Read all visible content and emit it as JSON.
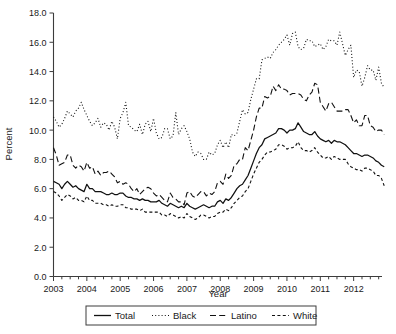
{
  "chart_data": {
    "type": "line",
    "title": "",
    "xlabel": "Year",
    "ylabel": "Percent",
    "ylim": [
      0.0,
      18.0
    ],
    "yticks": [
      0.0,
      2.0,
      4.0,
      6.0,
      8.0,
      10.0,
      12.0,
      14.0,
      16.0,
      18.0
    ],
    "ytick_labels": [
      "0.0",
      "2.0",
      "4.0",
      "6.0",
      "8.0",
      "10.0",
      "12.0",
      "14.0",
      "16.0",
      "18.0"
    ],
    "xlim": [
      2003.0,
      2012.85
    ],
    "xticks": [
      2003,
      2004,
      2005,
      2006,
      2007,
      2008,
      2009,
      2010,
      2011,
      2012
    ],
    "xtick_labels": [
      "2003",
      "2004",
      "2005",
      "2006",
      "2007",
      "2008",
      "2009",
      "2010",
      "2011",
      "2012"
    ],
    "minor_xticks_per_year": 4,
    "grid": false,
    "legend_position": "below-axis-centered",
    "legend_box": true,
    "x_start": 2003.0,
    "x_step": 0.0833333,
    "series": [
      {
        "name": "Total",
        "style": "solid",
        "dash": "none",
        "color": "#111111",
        "values": [
          6.5,
          6.4,
          6.3,
          6.0,
          6.3,
          6.5,
          6.3,
          6.1,
          6.2,
          6.0,
          5.9,
          5.8,
          6.3,
          6.0,
          6.0,
          5.8,
          5.8,
          5.8,
          5.7,
          5.6,
          5.6,
          5.7,
          5.6,
          5.6,
          5.7,
          5.7,
          5.5,
          5.4,
          5.4,
          5.3,
          5.3,
          5.2,
          5.3,
          5.2,
          5.2,
          5.1,
          5.1,
          5.1,
          5.2,
          5.0,
          4.9,
          4.8,
          5.0,
          4.9,
          4.8,
          4.7,
          4.8,
          4.7,
          5.0,
          4.8,
          4.7,
          4.6,
          4.7,
          4.8,
          4.9,
          4.8,
          4.7,
          4.8,
          4.8,
          5.1,
          5.2,
          5.0,
          5.3,
          5.2,
          5.4,
          5.7,
          6.0,
          6.2,
          6.3,
          6.6,
          6.9,
          7.4,
          7.9,
          8.4,
          8.8,
          9.0,
          9.4,
          9.5,
          9.6,
          9.7,
          9.8,
          10.1,
          10.1,
          10.0,
          9.8,
          10.0,
          10.0,
          10.1,
          10.5,
          10.2,
          9.9,
          9.8,
          9.7,
          9.7,
          9.9,
          9.6,
          9.4,
          9.3,
          9.2,
          9.3,
          9.1,
          9.3,
          9.2,
          9.2,
          9.1,
          9.0,
          8.8,
          8.6,
          8.4,
          8.4,
          8.3,
          8.2,
          8.3,
          8.3,
          8.2,
          8.1,
          7.9,
          7.8,
          7.6,
          7.5
        ]
      },
      {
        "name": "Black",
        "style": "dotted",
        "dash": "1,2.2",
        "color": "#111111",
        "values": [
          10.9,
          10.6,
          10.2,
          10.4,
          10.8,
          11.3,
          11.1,
          10.9,
          11.3,
          11.5,
          11.9,
          11.4,
          11.0,
          10.6,
          10.3,
          10.5,
          10.8,
          10.2,
          10.5,
          10.4,
          10.0,
          10.6,
          10.2,
          9.4,
          10.8,
          11.2,
          11.9,
          10.3,
          10.2,
          10.0,
          9.9,
          10.4,
          9.7,
          10.4,
          10.6,
          9.9,
          10.8,
          9.8,
          9.4,
          9.5,
          10.1,
          10.1,
          9.4,
          9.6,
          11.2,
          9.7,
          10.1,
          10.3,
          9.9,
          9.4,
          8.5,
          8.2,
          8.5,
          8.4,
          8.0,
          8.0,
          8.5,
          8.3,
          8.4,
          9.0,
          9.3,
          8.8,
          9.2,
          8.8,
          9.7,
          9.6,
          9.8,
          10.6,
          11.4,
          11.1,
          11.2,
          12.1,
          12.8,
          13.5,
          13.5,
          14.8,
          14.9,
          15.0,
          14.9,
          15.3,
          15.5,
          15.8,
          16.0,
          16.2,
          16.5,
          15.8,
          16.6,
          16.7,
          15.7,
          15.5,
          15.6,
          16.2,
          16.1,
          16.1,
          15.7,
          15.8,
          15.9,
          15.5,
          15.7,
          16.2,
          16.1,
          16.1,
          15.8,
          16.7,
          15.9,
          15.1,
          15.5,
          15.8,
          13.6,
          14.1,
          14.0,
          13.0,
          13.6,
          14.4,
          14.1,
          14.1,
          13.4,
          14.3,
          13.2,
          12.9
        ]
      },
      {
        "name": "Latino",
        "style": "dashed",
        "dash": "6,3.2",
        "color": "#111111",
        "values": [
          8.8,
          8.3,
          7.6,
          7.7,
          7.8,
          8.3,
          8.3,
          7.6,
          7.4,
          7.6,
          7.5,
          7.2,
          7.8,
          7.4,
          7.5,
          7.0,
          7.2,
          6.9,
          7.1,
          7.1,
          7.2,
          7.0,
          6.8,
          6.4,
          6.5,
          6.3,
          6.4,
          6.3,
          6.0,
          5.8,
          6.0,
          5.6,
          5.8,
          6.0,
          6.1,
          6.0,
          5.7,
          5.5,
          5.6,
          5.4,
          5.2,
          5.1,
          5.7,
          5.4,
          5.3,
          5.1,
          5.1,
          4.9,
          5.7,
          5.8,
          5.5,
          5.4,
          5.6,
          5.8,
          5.8,
          5.5,
          5.7,
          5.6,
          5.8,
          6.4,
          6.5,
          6.3,
          7.0,
          6.7,
          6.9,
          7.6,
          7.7,
          8.0,
          8.0,
          8.8,
          8.6,
          9.3,
          10.0,
          10.9,
          11.5,
          11.5,
          12.3,
          12.2,
          12.3,
          13.0,
          12.7,
          13.1,
          12.8,
          12.8,
          12.7,
          12.4,
          12.5,
          12.5,
          12.5,
          12.4,
          12.1,
          12.0,
          12.4,
          12.6,
          13.2,
          13.1,
          11.9,
          11.6,
          11.3,
          11.8,
          11.9,
          11.6,
          11.3,
          11.3,
          11.3,
          11.4,
          11.4,
          11.0,
          10.5,
          10.7,
          10.3,
          10.3,
          11.0,
          11.0,
          10.3,
          10.2,
          9.9,
          10.0,
          10.0,
          9.7
        ]
      },
      {
        "name": "White",
        "style": "dash-short",
        "dash": "3,2.4",
        "color": "#111111",
        "values": [
          5.8,
          5.7,
          5.5,
          5.2,
          5.4,
          5.6,
          5.5,
          5.3,
          5.4,
          5.2,
          5.2,
          5.1,
          5.5,
          5.2,
          5.2,
          5.0,
          5.0,
          5.0,
          4.9,
          4.9,
          4.8,
          4.9,
          4.8,
          4.8,
          4.9,
          4.9,
          4.7,
          4.7,
          4.6,
          4.6,
          4.6,
          4.5,
          4.6,
          4.4,
          4.4,
          4.4,
          4.4,
          4.4,
          4.4,
          4.2,
          4.2,
          4.1,
          4.3,
          4.2,
          4.1,
          4.0,
          4.1,
          4.0,
          4.3,
          4.1,
          4.0,
          3.9,
          4.0,
          4.2,
          4.2,
          4.1,
          4.0,
          4.1,
          4.1,
          4.3,
          4.4,
          4.4,
          4.6,
          4.5,
          4.7,
          5.0,
          5.2,
          5.4,
          5.5,
          5.8,
          6.0,
          6.5,
          7.0,
          7.4,
          7.8,
          8.0,
          8.3,
          8.5,
          8.5,
          8.6,
          8.7,
          9.0,
          9.0,
          8.9,
          8.7,
          8.8,
          8.8,
          8.9,
          9.2,
          8.8,
          8.6,
          8.6,
          8.5,
          8.6,
          8.8,
          8.5,
          8.3,
          8.1,
          8.1,
          8.2,
          8.0,
          8.2,
          8.1,
          8.0,
          8.0,
          8.0,
          7.7,
          7.5,
          7.4,
          7.3,
          7.3,
          7.2,
          7.4,
          7.4,
          7.3,
          7.2,
          6.9,
          6.9,
          6.7,
          6.2
        ]
      }
    ]
  },
  "legend": {
    "items": [
      {
        "label": "Total",
        "sample": "solid"
      },
      {
        "label": "Black",
        "sample": "dotted"
      },
      {
        "label": "Latino",
        "sample": "dashed"
      },
      {
        "label": "White",
        "sample": "dash-short"
      }
    ]
  }
}
